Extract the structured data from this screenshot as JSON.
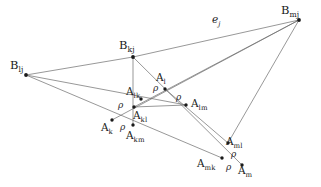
{
  "figure": {
    "canvas": {
      "width": 321,
      "height": 187
    },
    "stroke_color": "#6b6b6b",
    "node_color": "#1a1a1a",
    "text_color": "#1a1a1a",
    "background": "#ffffff"
  },
  "vertices": [
    {
      "id": "B_lj",
      "base": "B",
      "sub": "lj",
      "x": 26,
      "y": 75,
      "label_x": 10,
      "label_y": 60,
      "kind": "b-vertex"
    },
    {
      "id": "B_kj",
      "base": "B",
      "sub": "kj",
      "x": 133,
      "y": 57,
      "label_x": 119,
      "label_y": 40,
      "kind": "b-vertex"
    },
    {
      "id": "B_mj",
      "base": "B",
      "sub": "mj",
      "x": 299,
      "y": 20,
      "label_x": 281,
      "label_y": 5,
      "kind": "b-vertex"
    },
    {
      "id": "A_l",
      "base": "A",
      "sub": "l",
      "x": 165,
      "y": 89,
      "label_x": 156,
      "label_y": 72,
      "kind": "a-point"
    },
    {
      "id": "A_lk",
      "base": "A",
      "sub": "lk",
      "x": 141,
      "y": 99,
      "label_x": 126,
      "label_y": 86,
      "kind": "a-point"
    },
    {
      "id": "A_kl",
      "base": "A",
      "sub": "kl",
      "x": 134,
      "y": 107,
      "label_x": 133,
      "label_y": 110,
      "kind": "a-point"
    },
    {
      "id": "A_lm",
      "base": "A",
      "sub": "lm",
      "x": 186,
      "y": 105,
      "label_x": 191,
      "label_y": 98,
      "kind": "a-point"
    },
    {
      "id": "A_k",
      "base": "A",
      "sub": "k",
      "x": 112,
      "y": 120,
      "label_x": 101,
      "label_y": 122,
      "kind": "a-point"
    },
    {
      "id": "A_km",
      "base": "A",
      "sub": "km",
      "x": 133,
      "y": 125,
      "label_x": 126,
      "label_y": 130,
      "kind": "a-point"
    },
    {
      "id": "A_ml",
      "base": "A",
      "sub": "ml",
      "x": 228,
      "y": 143,
      "label_x": 226,
      "label_y": 136,
      "kind": "a-point"
    },
    {
      "id": "A_mk",
      "base": "A",
      "sub": "mk",
      "x": 222,
      "y": 158,
      "label_x": 197,
      "label_y": 158,
      "kind": "a-point"
    },
    {
      "id": "A_m",
      "base": "A",
      "sub": "m",
      "x": 242,
      "y": 165,
      "label_x": 238,
      "label_y": 165,
      "kind": "a-point"
    }
  ],
  "edges": [
    {
      "id": "e-blj-bkj",
      "from": "B_lj",
      "to": "B_kj"
    },
    {
      "id": "e-bkj-bmj",
      "from": "B_kj",
      "to": "B_mj"
    },
    {
      "id": "e-blj-alm",
      "from": "B_lj",
      "to": "A_lm"
    },
    {
      "id": "e-blj-amk",
      "from": "B_lj",
      "to": "A_mk"
    },
    {
      "id": "e-bkj-akm",
      "from": "B_kj",
      "to": "A_km"
    },
    {
      "id": "e-bkj-am",
      "from": "B_kj",
      "to": "A_m"
    },
    {
      "id": "e-bmj-ak",
      "from": "B_mj",
      "to": "A_k"
    },
    {
      "id": "e-bmj-akl",
      "from": "B_mj",
      "to": "A_kl"
    },
    {
      "id": "e-bmj-aml",
      "from": "B_mj",
      "to": "A_ml"
    },
    {
      "id": "e-al-aml",
      "from": "A_l",
      "to": "A_ml"
    },
    {
      "id": "e-akl-alm",
      "from": "A_kl",
      "to": "A_lm"
    }
  ],
  "edge_labels": [
    {
      "id": "e_j",
      "base": "e",
      "sub": "j",
      "x": 212,
      "y": 14
    }
  ],
  "rho_marks": [
    {
      "id": "rho-1",
      "symbol": "ρ",
      "x": 153,
      "y": 84,
      "near": "A_lk-A_l"
    },
    {
      "id": "rho-2",
      "symbol": "ρ",
      "x": 176,
      "y": 93,
      "near": "A_l-A_lm"
    },
    {
      "id": "rho-3",
      "symbol": "ρ",
      "x": 118,
      "y": 101,
      "near": "A_lk-A_kl"
    },
    {
      "id": "rho-4",
      "symbol": "ρ",
      "x": 120,
      "y": 123,
      "near": "A_k-A_km"
    },
    {
      "id": "rho-5",
      "symbol": "ρ",
      "x": 231,
      "y": 150,
      "near": "A_ml-A_m"
    },
    {
      "id": "rho-6",
      "symbol": "ρ",
      "x": 226,
      "y": 163,
      "near": "A_mk-A_m"
    }
  ]
}
